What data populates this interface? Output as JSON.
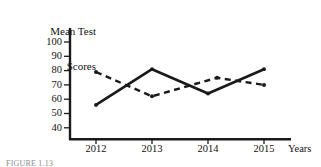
{
  "chart_data": {
    "type": "line",
    "title": "Mean Test Scores",
    "xlabel": "Years",
    "ylabel": "Mean Test Scores",
    "categories": [
      "2012",
      "2013",
      "2014",
      "2015"
    ],
    "x_tick_labels": [
      "2012",
      "2013",
      "2014",
      "2015"
    ],
    "y_tick_labels": [
      "100",
      "90",
      "80",
      "70",
      "60",
      "50",
      "40"
    ],
    "y_ticks": [
      100,
      90,
      80,
      70,
      60,
      50,
      40
    ],
    "ylim": [
      35,
      105
    ],
    "grid": false,
    "legend": "none",
    "series": [
      {
        "name": "solid-line-series",
        "style": "solid",
        "color": "#1a1a1a",
        "values": [
          56,
          81,
          64,
          81
        ]
      },
      {
        "name": "dashed-line-series",
        "style": "dashed",
        "color": "#1a1a1a",
        "values": [
          79,
          62,
          75,
          70
        ]
      }
    ]
  },
  "labels": {
    "y_title_line1": "Mean Test",
    "y_title_line2": "Scores",
    "x_title": "Years",
    "y_100": "100",
    "y_90": "90",
    "y_80": "80",
    "y_70": "70",
    "y_60": "60",
    "y_50": "50",
    "y_40": "40",
    "x_2012": "2012",
    "x_2013": "2013",
    "x_2014": "2014",
    "x_2015": "2015"
  },
  "caption": "FIGURE 1.13",
  "colors": {
    "axis": "#1a1a1a",
    "line": "#1a1a1a",
    "background": "#ffffff"
  }
}
